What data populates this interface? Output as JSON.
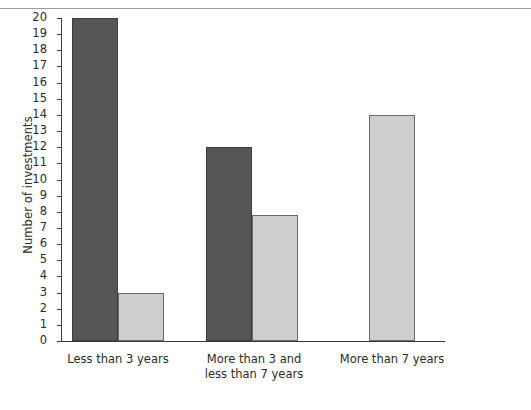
{
  "chart_data": {
    "type": "bar",
    "title": "",
    "xlabel": "",
    "ylabel": "Number of investments",
    "ylim": [
      0,
      20
    ],
    "ytick_step": 1,
    "yticks": [
      20,
      19,
      18,
      17,
      16,
      15,
      14,
      13,
      12,
      11,
      10,
      9,
      8,
      7,
      6,
      5,
      4,
      3,
      2,
      1,
      0
    ],
    "grid": false,
    "legend": "none",
    "categories": [
      "Less than 3 years",
      "More than 3 and\nless than 7 years",
      "More than 7 years"
    ],
    "series": [
      {
        "name": "dark-series",
        "color": "#565656",
        "values": [
          20,
          12,
          0
        ]
      },
      {
        "name": "light-series",
        "color": "#cecece",
        "values": [
          3,
          7.8,
          14
        ]
      }
    ]
  },
  "colors": {
    "dark_bar": "#565656",
    "light_bar": "#cecece",
    "bar_outline": "#4a4a4a",
    "axis": "#3a3a3a",
    "text": "#2b2b2b",
    "background": "#ffffff",
    "top_rule": "#9a9a9a"
  }
}
